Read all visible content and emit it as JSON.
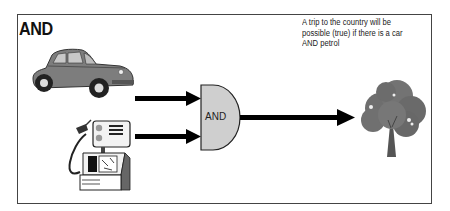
{
  "diagram": {
    "title": "AND",
    "caption": "A trip to the country will be possible (true) if there is a car AND petrol",
    "inputs": [
      {
        "name": "car",
        "icon": "car-icon"
      },
      {
        "name": "petrol",
        "icon": "petrol-pump-icon"
      }
    ],
    "gate": {
      "label": "AND",
      "fill": "#cfcfcf"
    },
    "output": {
      "name": "trip to the country",
      "icon": "tree-icon"
    },
    "colors": {
      "arrow": "#000000",
      "car": "#7a7a7a",
      "tree": "#6b6b6b",
      "frame": "#444444"
    }
  }
}
